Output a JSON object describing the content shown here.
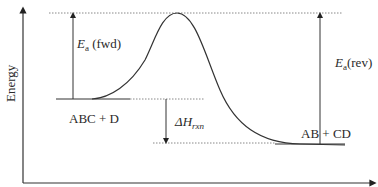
{
  "diagram": {
    "type": "reaction-energy-profile",
    "axes": {
      "y_label": "Energy",
      "x_label": ""
    },
    "labels": {
      "reactants": "ABC + D",
      "products": "AB + CD",
      "ea_fwd_symbol": "E",
      "ea_fwd_sub": "a",
      "ea_fwd_text": " (fwd)",
      "ea_rev_symbol": "E",
      "ea_rev_sub": "a",
      "ea_rev_text": "(rev)",
      "dh_symbol": "ΔH",
      "dh_sub": "rxn"
    },
    "colors": {
      "line": "#333333",
      "dotted": "#888888"
    }
  }
}
